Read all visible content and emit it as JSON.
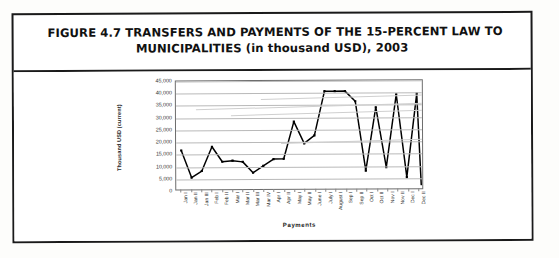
{
  "figure": {
    "title_line1": "FIGURE 4.7 TRANSFERS AND PAYMENTS OF THE 15-PERCENT LAW TO",
    "title_line2": "MUNICIPALITIES (in thousand USD), 2003"
  },
  "chart_data": {
    "type": "line",
    "title": "Transfers and Payments of the 15-Percent Law to Municipalities (in thousand USD), 2003",
    "xlabel": "Payments",
    "ylabel": "Thousand USD (current)",
    "ylim": [
      0,
      45000
    ],
    "ytick_values": [
      0,
      5000,
      10000,
      15000,
      20000,
      25000,
      30000,
      35000,
      40000,
      45000
    ],
    "ytick_labels": [
      "0",
      "5,000",
      "10,000",
      "15,000",
      "20,000",
      "25,000",
      "30,000",
      "35,000",
      "40,000",
      "45,000"
    ],
    "grid": true,
    "legend": false,
    "units": "thousand USD (current)",
    "year": 2003,
    "categories": [
      "Jan I",
      "Jan II",
      "Jan III",
      "Feb I",
      "Feb II",
      "Mar I",
      "Mar II",
      "Mar III",
      "Mar IV",
      "Apr I",
      "Apr II",
      "May I",
      "May II",
      "June I",
      "July I",
      "August I",
      "Sep I",
      "Sep II",
      "Oct I",
      "Oct II",
      "Nov I",
      "Nov II",
      "Dec I",
      "Dec II"
    ],
    "series": [
      {
        "name": "Payments",
        "color": "#000000",
        "values": [
          16500,
          5300,
          8000,
          18000,
          11800,
          12200,
          11700,
          7200,
          10000,
          12800,
          12900,
          28200,
          19200,
          22500,
          40700,
          40700,
          40700,
          36500,
          7900,
          34000,
          9300,
          39300,
          5100,
          39500
        ]
      }
    ],
    "final_value": 2000
  }
}
